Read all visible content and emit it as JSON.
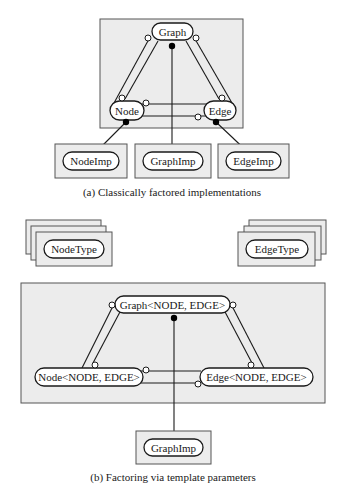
{
  "figure_a": {
    "caption": "(a) Classically factored implementations",
    "nodes": {
      "graph": "Graph",
      "node": "Node",
      "edge": "Edge"
    },
    "implementations": [
      "NodeImp",
      "GraphImp",
      "EdgeImp"
    ]
  },
  "figure_b": {
    "caption": "(b) Factoring via template parameters",
    "type_params": [
      "NodeType",
      "EdgeType"
    ],
    "nodes": {
      "graph": "Graph<NODE, EDGE>",
      "node": "Node<NODE, EDGE>",
      "edge": "Edge<NODE, EDGE>"
    },
    "implementation": "GraphImp"
  },
  "colors": {
    "box_fill": "#ececec",
    "box_stroke": "#555555",
    "ink": "#1a1a1a"
  }
}
